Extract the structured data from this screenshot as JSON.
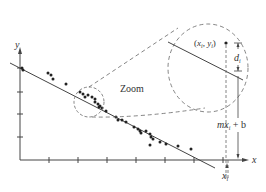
{
  "diagram": {
    "axis_labels": {
      "x": "x",
      "y": "y"
    },
    "zoom_label": "Zoom",
    "point_label": {
      "x": "x",
      "sub": "i",
      "y": "y",
      "open": "(",
      "comma": ", ",
      "close": ")"
    },
    "distance_label": {
      "d": "d",
      "sub": "i"
    },
    "line_value_label": {
      "m": "m",
      "x": "x",
      "sub": "i",
      "rest": " + b"
    },
    "xi_label": {
      "x": "x",
      "sub": "i"
    },
    "colors": {
      "ink": "#333333",
      "line": "#444444",
      "dash": "#666666"
    },
    "points": [
      [
        22,
        68
      ],
      [
        23,
        70
      ],
      [
        48,
        73
      ],
      [
        51,
        75
      ],
      [
        53,
        79
      ],
      [
        66,
        84
      ],
      [
        80,
        92
      ],
      [
        83,
        94
      ],
      [
        85,
        97
      ],
      [
        88,
        95
      ],
      [
        92,
        97
      ],
      [
        95,
        99
      ],
      [
        95,
        102
      ],
      [
        98,
        104
      ],
      [
        99,
        107
      ],
      [
        100,
        106
      ],
      [
        102,
        108
      ],
      [
        106,
        111
      ],
      [
        116,
        117
      ],
      [
        118,
        120
      ],
      [
        122,
        120
      ],
      [
        126,
        122
      ],
      [
        134,
        127
      ],
      [
        138,
        129
      ],
      [
        140,
        131
      ],
      [
        141,
        133
      ],
      [
        146,
        131
      ],
      [
        150,
        134
      ],
      [
        151,
        137
      ],
      [
        153,
        139
      ],
      [
        150,
        145
      ],
      [
        160,
        142
      ],
      [
        166,
        144
      ],
      [
        178,
        146
      ],
      [
        191,
        149
      ]
    ]
  }
}
